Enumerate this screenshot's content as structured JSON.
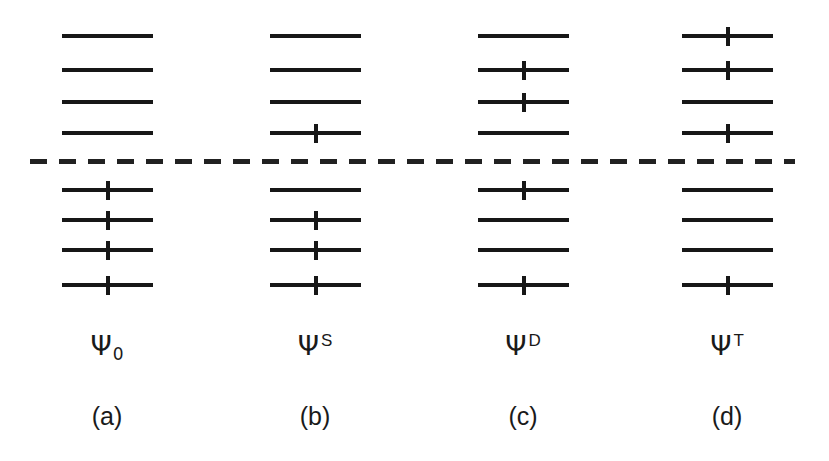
{
  "figure": {
    "background_color": "#ffffff",
    "ink_color": "#171717",
    "width": 829,
    "height": 461,
    "fermi_line": {
      "name": "fermi-level-dashed-line",
      "x": 30,
      "y": 161,
      "width": 765,
      "dash_length": 17,
      "dash_gap": 12,
      "thickness": 5,
      "color": "#212121"
    },
    "level_geometry": {
      "line_width": 91,
      "line_thickness": 4,
      "tick_width": 4,
      "tick_height": 19,
      "virtual_y": [
        36,
        70,
        102,
        133
      ],
      "occupied_y": [
        190,
        220,
        250,
        285
      ]
    },
    "columns": [
      {
        "id": "column-a",
        "panel_label": "(a)",
        "wavefunction": {
          "symbol": "Ψ",
          "subscript": "0",
          "superscript": ""
        },
        "label_center_x": 107,
        "line_left": 62,
        "virtual_levels": [
          {
            "index": 1,
            "occupied": false
          },
          {
            "index": 2,
            "occupied": false
          },
          {
            "index": 3,
            "occupied": false
          },
          {
            "index": 4,
            "occupied": false
          }
        ],
        "occupied_levels": [
          {
            "index": 1,
            "occupied": true
          },
          {
            "index": 2,
            "occupied": true
          },
          {
            "index": 3,
            "occupied": true
          },
          {
            "index": 4,
            "occupied": true
          }
        ]
      },
      {
        "id": "column-b",
        "panel_label": "(b)",
        "wavefunction": {
          "symbol": "Ψ",
          "subscript": "",
          "superscript": "S"
        },
        "label_center_x": 315,
        "line_left": 270,
        "virtual_levels": [
          {
            "index": 1,
            "occupied": false
          },
          {
            "index": 2,
            "occupied": false
          },
          {
            "index": 3,
            "occupied": false
          },
          {
            "index": 4,
            "occupied": true
          }
        ],
        "occupied_levels": [
          {
            "index": 1,
            "occupied": false
          },
          {
            "index": 2,
            "occupied": true
          },
          {
            "index": 3,
            "occupied": true
          },
          {
            "index": 4,
            "occupied": true
          }
        ]
      },
      {
        "id": "column-c",
        "panel_label": "(c)",
        "wavefunction": {
          "symbol": "Ψ",
          "subscript": "",
          "superscript": "D"
        },
        "label_center_x": 523,
        "line_left": 478,
        "virtual_levels": [
          {
            "index": 1,
            "occupied": false
          },
          {
            "index": 2,
            "occupied": true
          },
          {
            "index": 3,
            "occupied": true
          },
          {
            "index": 4,
            "occupied": false
          }
        ],
        "occupied_levels": [
          {
            "index": 1,
            "occupied": true
          },
          {
            "index": 2,
            "occupied": false
          },
          {
            "index": 3,
            "occupied": false
          },
          {
            "index": 4,
            "occupied": true
          }
        ]
      },
      {
        "id": "column-d",
        "panel_label": "(d)",
        "wavefunction": {
          "symbol": "Ψ",
          "subscript": "",
          "superscript": "T"
        },
        "label_center_x": 727,
        "line_left": 682,
        "virtual_levels": [
          {
            "index": 1,
            "occupied": true
          },
          {
            "index": 2,
            "occupied": true
          },
          {
            "index": 3,
            "occupied": false
          },
          {
            "index": 4,
            "occupied": true
          }
        ],
        "occupied_levels": [
          {
            "index": 1,
            "occupied": false
          },
          {
            "index": 2,
            "occupied": false
          },
          {
            "index": 3,
            "occupied": false
          },
          {
            "index": 4,
            "occupied": true
          }
        ]
      }
    ],
    "label_rows": {
      "wavefunction_y": 332,
      "panel_y": 404
    }
  }
}
